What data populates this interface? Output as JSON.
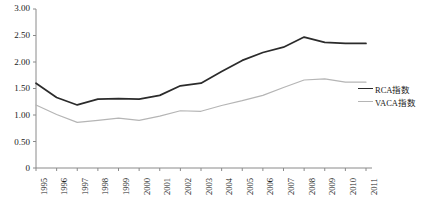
{
  "chart_data": {
    "type": "line",
    "title": "",
    "xlabel": "",
    "ylabel": "",
    "ylim": [
      0,
      3.0
    ],
    "grid": false,
    "legend_position": "right",
    "categories": [
      "1995",
      "1996",
      "1997",
      "1998",
      "1999",
      "2000",
      "2001",
      "2002",
      "2003",
      "2004",
      "2005",
      "2006",
      "2007",
      "2008",
      "2009",
      "2010",
      "2011"
    ],
    "y_ticks": [
      "0",
      "0.50",
      "1.00",
      "1.50",
      "2.00",
      "2.50",
      "3.00"
    ],
    "y_tick_values": [
      0,
      0.5,
      1.0,
      1.5,
      2.0,
      2.5,
      3.0
    ],
    "series": [
      {
        "name": "RCA指数",
        "color": "#2b2b2b",
        "values": [
          1.6,
          1.33,
          1.19,
          1.3,
          1.31,
          1.3,
          1.37,
          1.55,
          1.6,
          1.82,
          2.03,
          2.18,
          2.28,
          2.47,
          2.37,
          2.35,
          2.35
        ]
      },
      {
        "name": "VACA指数",
        "color": "#b5b5b5",
        "values": [
          1.19,
          1.01,
          0.86,
          0.9,
          0.94,
          0.9,
          0.98,
          1.08,
          1.07,
          1.18,
          1.27,
          1.37,
          1.52,
          1.66,
          1.68,
          1.62,
          1.62
        ]
      }
    ]
  },
  "axis": {
    "axis_color": "#8a8a8a"
  }
}
